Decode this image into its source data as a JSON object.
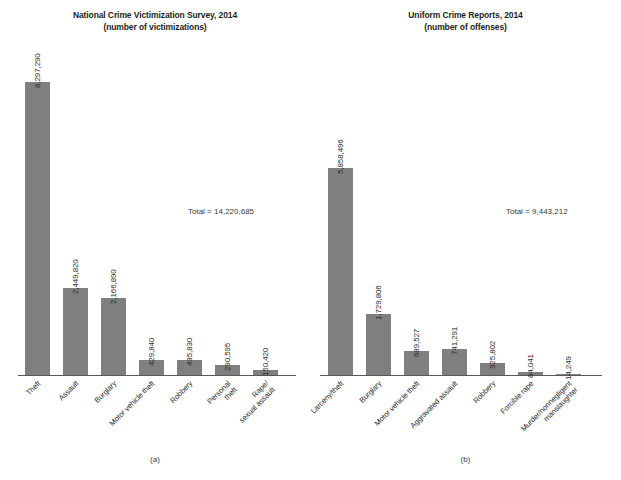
{
  "figure": {
    "background_color": "#ffffff",
    "bar_color": "#7f7f7f",
    "axis_color": "#58595b"
  },
  "panels": [
    {
      "caption": "(a)",
      "title_line1": "National Crime Victimization Survey, 2014",
      "title_line2": "(number of victimizations)",
      "total_label": "Total = 14,220,685"
    },
    {
      "caption": "(b)",
      "title_line1": "Uniform Crime Reports, 2014",
      "title_line2": "(number of offenses)",
      "total_label": "Total = 9,443,212"
    }
  ],
  "chart_data": [
    {
      "type": "bar",
      "title": "National Crime Victimization Survey, 2014 (number of victimizations)",
      "subtitle": "(number of victimizations)",
      "panel_caption": "(a)",
      "xlabel": "",
      "ylabel": "",
      "ylim": [
        0,
        8297290
      ],
      "grid": false,
      "legend": "none",
      "orientation": "vertical",
      "total": 14220685,
      "total_label": "Total = 14,220,685",
      "categories": [
        "Theft",
        "Assault",
        "Burglary",
        "Motor vehicle theft",
        "Robbery",
        "Personal theft",
        "Rape/ sexual assault"
      ],
      "category_lines": [
        [
          "Theft"
        ],
        [
          "Assault"
        ],
        [
          "Burglary"
        ],
        [
          "Motor vehicle theft"
        ],
        [
          "Robbery"
        ],
        [
          "Personal",
          "theft"
        ],
        [
          "Rape/",
          "sexual assault"
        ]
      ],
      "values": [
        8297290,
        2449820,
        2166890,
        429840,
        435830,
        290595,
        150420
      ],
      "value_labels": [
        "8,297,290",
        "2,449,820",
        "2,166,890",
        "429,840",
        "435,830",
        "290,595",
        "150,420"
      ]
    },
    {
      "type": "bar",
      "title": "Uniform Crime Reports, 2014 (number of offenses)",
      "subtitle": "(number of offenses)",
      "panel_caption": "(b)",
      "xlabel": "",
      "ylabel": "",
      "ylim": [
        0,
        8297290
      ],
      "grid": false,
      "legend": "none",
      "orientation": "vertical",
      "total": 9443212,
      "total_label": "Total = 9,443,212",
      "categories": [
        "Larceny/theft",
        "Burglary",
        "Motor vehicle theft",
        "Aggravated assault",
        "Robbery",
        "Forcible rape",
        "Murder/nonnegligent manslaughter"
      ],
      "category_lines": [
        [
          "Larceny/theft"
        ],
        [
          "Burglary"
        ],
        [
          "Motor vehicle theft"
        ],
        [
          "Aggravated assault"
        ],
        [
          "Robbery"
        ],
        [
          "Forcible rape"
        ],
        [
          "Murder/nonnegligent",
          "manslaughter"
        ]
      ],
      "values": [
        5858496,
        1729806,
        689527,
        741291,
        325802,
        84041,
        14249
      ],
      "value_labels": [
        "5,858,496",
        "1,729,806",
        "689,527",
        "741,291",
        "325,802",
        "84,041",
        "14,249"
      ]
    }
  ]
}
